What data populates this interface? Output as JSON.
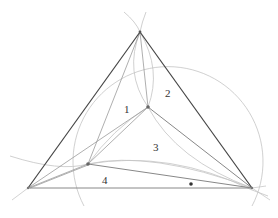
{
  "diagram": {
    "region_labels": [
      "1",
      "2",
      "3",
      "4"
    ],
    "marker": "dot"
  }
}
